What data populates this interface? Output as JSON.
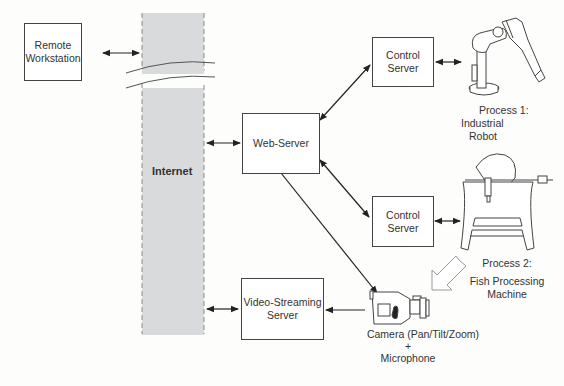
{
  "diagram": {
    "nodes": {
      "remote_workstation": {
        "line1": "Remote",
        "line2": "Workstation"
      },
      "internet": {
        "label": "Internet"
      },
      "web_server": {
        "label": "Web-Server"
      },
      "control_server_1": {
        "line1": "Control",
        "line2": "Server"
      },
      "control_server_2": {
        "line1": "Control",
        "line2": "Server"
      },
      "video_server": {
        "line1": "Video-Streaming",
        "line2": "Server"
      },
      "process1": {
        "line1": "Process 1:",
        "line2": "Industrial",
        "line3": "Robot"
      },
      "process2": {
        "line1": "Process 2:",
        "line2": "Fish Processing",
        "line3": "Machine"
      },
      "camera": {
        "line1": "Camera (Pan/Tilt/Zoom)",
        "line2": "+",
        "line3": "Microphone"
      }
    },
    "edges": [
      {
        "from": "remote_workstation",
        "to": "internet",
        "type": "bidirectional"
      },
      {
        "from": "internet",
        "to": "web_server",
        "type": "bidirectional"
      },
      {
        "from": "web_server",
        "to": "control_server_1",
        "type": "bidirectional"
      },
      {
        "from": "web_server",
        "to": "control_server_2",
        "type": "bidirectional"
      },
      {
        "from": "web_server",
        "to": "camera",
        "type": "directed"
      },
      {
        "from": "control_server_1",
        "to": "process1",
        "type": "bidirectional"
      },
      {
        "from": "control_server_2",
        "to": "process2",
        "type": "bidirectional"
      },
      {
        "from": "camera",
        "to": "video_server",
        "type": "directed"
      },
      {
        "from": "video_server",
        "to": "internet",
        "type": "bidirectional"
      },
      {
        "from": "process2",
        "to": "camera",
        "type": "view-arrow"
      }
    ],
    "colors": {
      "internet_fill": "#d9dadc",
      "line": "#333333",
      "box_border": "#444444"
    }
  }
}
